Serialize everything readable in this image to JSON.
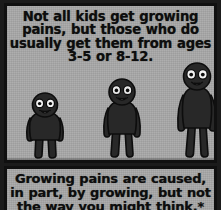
{
  "comic": {
    "background_color": "#a9a9a9",
    "ink_color": "#101010",
    "panels": [
      {
        "name": "top-panel",
        "caption_lines": [
          "Not all kids get growing",
          "pains, but those who do",
          "usually get them from ages",
          "3-5 or 8-12."
        ],
        "figures": [
          {
            "name": "child",
            "label": "young child figure",
            "relative_height": "shortest",
            "face": {
              "eyes": 2,
              "mouth": "open smile"
            },
            "body_color": "#2a2a2a"
          },
          {
            "name": "preteen",
            "label": "pre-teen figure",
            "relative_height": "medium",
            "face": {
              "eyes": 2,
              "mouth": "open smile"
            },
            "body_color": "#2a2a2a"
          },
          {
            "name": "teen",
            "label": "teenager figure",
            "relative_height": "tallest",
            "face": {
              "eyes": 2,
              "mouth": "open smile"
            },
            "body_color": "#2a2a2a"
          }
        ]
      },
      {
        "name": "bottom-panel",
        "caption_lines": [
          "Growing pains are caused,",
          "in part, by growing, but not",
          "the way you might think.*"
        ]
      }
    ]
  }
}
